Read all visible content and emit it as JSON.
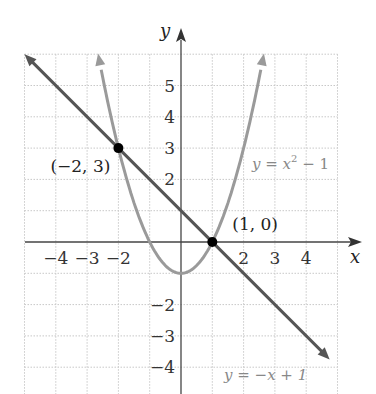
{
  "chart_data": {
    "type": "line",
    "title": "",
    "xlabel": "x",
    "ylabel": "y",
    "xlim": [
      -5,
      5
    ],
    "ylim": [
      -4.5,
      6
    ],
    "grid": true,
    "x_ticks": [
      "−4",
      "−3",
      "−2",
      "2",
      "3",
      "4"
    ],
    "y_ticks": [
      "5",
      "4",
      "3",
      "2",
      "−2",
      "−3",
      "−4"
    ],
    "series": [
      {
        "name": "y = x² − 1",
        "label_main": "y = x",
        "label_sup": "2",
        "label_tail": " − 1",
        "kind": "parabola",
        "a": 1,
        "b": 0,
        "c": -1,
        "color": "#9a9a9a"
      },
      {
        "name": "y = −x + 1",
        "label": "y = −x + 1",
        "kind": "line",
        "slope": -1,
        "intercept": 1,
        "color": "#555555"
      }
    ],
    "points": [
      {
        "x": -2,
        "y": 3,
        "label": "(−2, 3)"
      },
      {
        "x": 1,
        "y": 0,
        "label": "(1, 0)"
      }
    ]
  }
}
